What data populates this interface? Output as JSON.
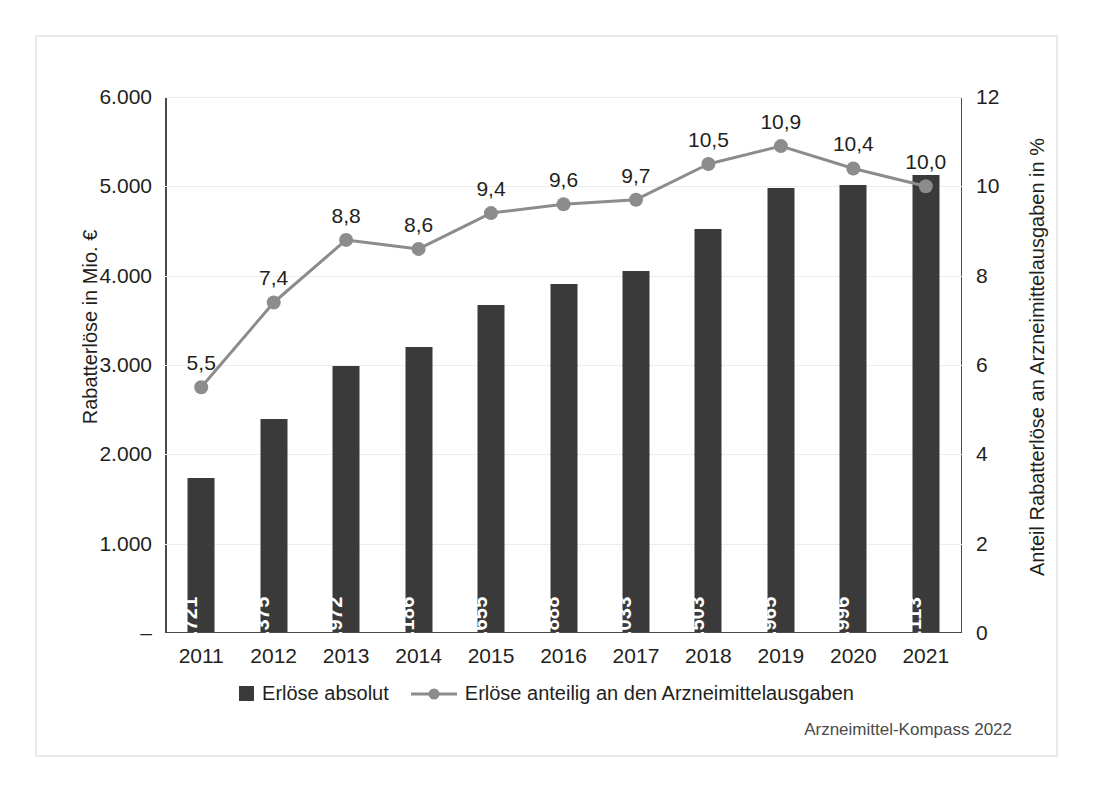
{
  "chart_data": {
    "type": "bar",
    "title": "",
    "subtitle": "",
    "categories": [
      "2011",
      "2012",
      "2013",
      "2014",
      "2015",
      "2016",
      "2017",
      "2018",
      "2019",
      "2020",
      "2021"
    ],
    "xlabel": "",
    "ylabel": "Rabatterlöse in Mio. €",
    "ylabel_secondary": "Anteil Rabatterlöse an Arzneimittelausgaben in %",
    "ylim": [
      0,
      6000
    ],
    "ylim_secondary": [
      0,
      12
    ],
    "yticks": [
      "–",
      "1.000",
      "2.000",
      "3.000",
      "4.000",
      "5.000",
      "6.000"
    ],
    "ytick_values": [
      0,
      1000,
      2000,
      3000,
      4000,
      5000,
      6000
    ],
    "yticks_secondary": [
      "0",
      "2",
      "4",
      "6",
      "8",
      "10",
      "12"
    ],
    "ytick_values_secondary": [
      0,
      2,
      4,
      6,
      8,
      10,
      12
    ],
    "grid": true,
    "legend_position": "bottom",
    "series": [
      {
        "name": "Erlöse absolut",
        "type": "bar",
        "axis": "left",
        "color": "#3a3a3a",
        "values": [
          1721,
          2375,
          2972,
          3186,
          3655,
          3888,
          4033,
          4503,
          4965,
          4996,
          5113
        ],
        "labels": [
          "1.721",
          "2.375",
          "2.972",
          "3.186",
          "3.655",
          "3.888",
          "4.033",
          "4.503",
          "4.965",
          "4.996",
          "5.113"
        ]
      },
      {
        "name": "Erlöse anteilig an den Arzneimittelausgaben",
        "type": "line",
        "axis": "right",
        "color": "#8c8c8c",
        "values": [
          5.5,
          7.4,
          8.8,
          8.6,
          9.4,
          9.6,
          9.7,
          10.5,
          10.9,
          10.4,
          10.0
        ],
        "labels": [
          "5,5",
          "7,4",
          "8,8",
          "8,6",
          "9,4",
          "9,6",
          "9,7",
          "10,5",
          "10,9",
          "10,4",
          "10,0"
        ]
      }
    ]
  },
  "source": {
    "text": "Arzneimittel-Kompass 2022"
  },
  "colors": {
    "bar": "#3a3a3a",
    "line": "#8c8c8c",
    "axis": "#4a4a4a",
    "grid": "#ededed",
    "frame": "#e9e9e9",
    "text": "#231f20"
  }
}
